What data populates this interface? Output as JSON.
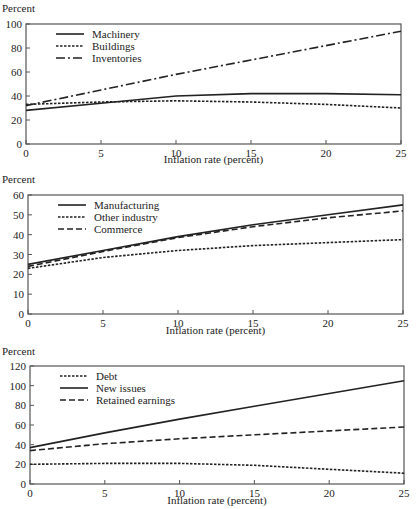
{
  "chart_data": [
    {
      "type": "line",
      "title": "",
      "ylabel": "Percent",
      "xlabel": "Inflation rate (percent)",
      "xlim": [
        0,
        25
      ],
      "ylim": [
        0,
        100
      ],
      "xticks": [
        0,
        5,
        10,
        15,
        20,
        25
      ],
      "yticks": [
        0,
        20,
        40,
        60,
        80,
        100
      ],
      "grid": false,
      "legend": "top-left",
      "x": [
        0,
        5,
        10,
        15,
        20,
        25
      ],
      "series": [
        {
          "name": "Machinery",
          "style": "solid",
          "values": [
            28,
            34,
            40,
            42,
            42,
            41
          ]
        },
        {
          "name": "Buildings",
          "style": "dotted",
          "values": [
            33,
            35,
            36,
            35,
            33,
            30
          ]
        },
        {
          "name": "Inventories",
          "style": "dashdot",
          "values": [
            32,
            45,
            58,
            70,
            82,
            94
          ]
        }
      ]
    },
    {
      "type": "line",
      "title": "",
      "ylabel": "Percent",
      "xlabel": "Inflation rate (percent)",
      "xlim": [
        0,
        25
      ],
      "ylim": [
        0,
        60
      ],
      "xticks": [
        0,
        5,
        10,
        15,
        20,
        25
      ],
      "yticks": [
        0,
        10,
        20,
        30,
        40,
        50,
        60
      ],
      "grid": false,
      "legend": "top-left",
      "x": [
        0,
        5,
        10,
        15,
        20,
        25
      ],
      "series": [
        {
          "name": "Manufacturing",
          "style": "solid",
          "values": [
            25,
            32,
            39,
            45,
            50,
            55
          ]
        },
        {
          "name": "Other industry",
          "style": "dotted",
          "values": [
            23,
            28.5,
            32,
            34.5,
            36,
            37.5
          ]
        },
        {
          "name": "Commerce",
          "style": "dashed",
          "values": [
            24,
            31.5,
            38.5,
            44,
            48.5,
            52
          ]
        }
      ]
    },
    {
      "type": "line",
      "title": "",
      "ylabel": "Percent",
      "xlabel": "Inflation rate (percent)",
      "xlim": [
        0,
        25
      ],
      "ylim": [
        0,
        120
      ],
      "xticks": [
        0,
        5,
        10,
        15,
        20,
        25
      ],
      "yticks": [
        0,
        20,
        40,
        60,
        80,
        100,
        120
      ],
      "grid": false,
      "legend": "top-left",
      "x": [
        0,
        5,
        10,
        15,
        20,
        25
      ],
      "series": [
        {
          "name": "Debt",
          "style": "dotted",
          "values": [
            20,
            21,
            21,
            19,
            15,
            11
          ]
        },
        {
          "name": "New issues",
          "style": "solid",
          "values": [
            37,
            52,
            66,
            79,
            92,
            105
          ]
        },
        {
          "name": "Retained earnings",
          "style": "dashed",
          "values": [
            34,
            41,
            46,
            50,
            54,
            58
          ]
        }
      ]
    }
  ]
}
